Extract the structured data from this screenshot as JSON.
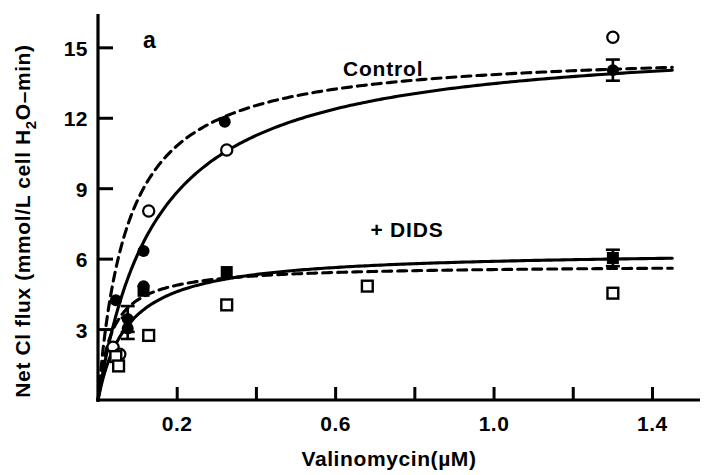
{
  "figure": {
    "panel_label": "a",
    "background_color": "#ffffff",
    "ink_color": "#000000"
  },
  "chart_data": {
    "type": "scatter",
    "title": "",
    "panel": "a",
    "xlabel": "Valinomycin(µM)",
    "ylabel_parts": {
      "before": "Net Cl flux (mmol/L cell H",
      "sub": "2",
      "after": "O–min)"
    },
    "ylabel": "Net Cl flux (mmol/L cell H2O-min)",
    "xlim": [
      0,
      1.52
    ],
    "ylim": [
      0,
      16.1
    ],
    "xticks": [
      0.2,
      0.4,
      0.6,
      0.8,
      1.0,
      1.2,
      1.4
    ],
    "xtick_labels": [
      "0.2",
      "",
      "0.6",
      "",
      "1.0",
      "",
      "1.4"
    ],
    "yticks": [
      3,
      6,
      9,
      12,
      15
    ],
    "ytick_labels": [
      "3",
      "6",
      "9",
      "12",
      "15"
    ],
    "grid": false,
    "legend_position": "inline-annotation",
    "annotations": [
      {
        "text": "Control",
        "x": 0.72,
        "y": 13.8
      },
      {
        "text": "+ DIDS",
        "x": 0.78,
        "y": 6.95
      }
    ],
    "series": [
      {
        "name": "Control filled circle",
        "marker": "filled-circle",
        "curve": "dashed",
        "points": [
          {
            "x": 0.045,
            "y": 4.25
          },
          {
            "x": 0.075,
            "y": 3.45,
            "yerr": 0.55
          },
          {
            "x": 0.075,
            "y": 3.05,
            "yerr": 0.45
          },
          {
            "x": 0.115,
            "y": 6.35
          },
          {
            "x": 0.115,
            "y": 4.85
          },
          {
            "x": 0.32,
            "y": 11.85
          },
          {
            "x": 1.3,
            "y": 14.05,
            "yerr": 0.45
          }
        ]
      },
      {
        "name": "Control open circle",
        "marker": "open-circle",
        "curve": "solid",
        "points": [
          {
            "x": 0.038,
            "y": 2.25
          },
          {
            "x": 0.055,
            "y": 1.95
          },
          {
            "x": 0.128,
            "y": 8.05
          },
          {
            "x": 0.325,
            "y": 10.65
          },
          {
            "x": 1.3,
            "y": 15.45
          }
        ]
      },
      {
        "name": "+ DIDS filled square",
        "marker": "filled-square",
        "curve": "dashed",
        "points": [
          {
            "x": 0.115,
            "y": 4.65
          },
          {
            "x": 0.325,
            "y": 5.45
          },
          {
            "x": 1.3,
            "y": 6.05,
            "yerr": 0.35
          }
        ]
      },
      {
        "name": "+ DIDS open square",
        "marker": "open-square",
        "curve": "solid",
        "points": [
          {
            "x": 0.045,
            "y": 1.85
          },
          {
            "x": 0.052,
            "y": 1.45
          },
          {
            "x": 0.128,
            "y": 2.75
          },
          {
            "x": 0.325,
            "y": 4.05
          },
          {
            "x": 0.68,
            "y": 4.85
          },
          {
            "x": 1.3,
            "y": 4.55
          }
        ]
      }
    ],
    "curves": [
      {
        "name": "control-dashed",
        "style": "dashed",
        "vmax": 14.9,
        "km": 0.075,
        "x_start": 0.012,
        "x_end": 1.45
      },
      {
        "name": "control-solid",
        "style": "solid",
        "vmax": 15.5,
        "km": 0.15,
        "x_start": 0.012,
        "x_end": 1.45
      },
      {
        "name": "dids-dashed",
        "style": "dashed",
        "vmax": 5.75,
        "km": 0.035,
        "x_start": 0.008,
        "x_end": 1.45
      },
      {
        "name": "dids-solid",
        "style": "solid",
        "vmax": 6.35,
        "km": 0.075,
        "x_start": 0.008,
        "x_end": 1.45
      }
    ]
  }
}
